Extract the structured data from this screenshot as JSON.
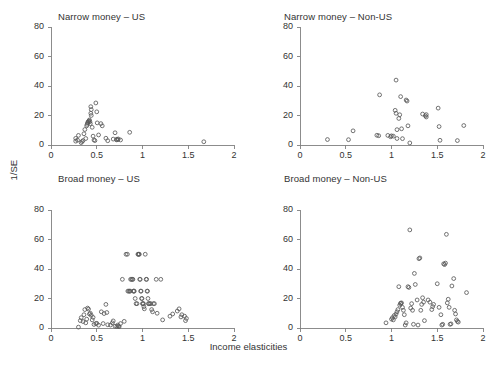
{
  "figure": {
    "xlabel": "Income elasticities",
    "ylabel": "1/SE",
    "background": "#ffffff",
    "marker_color": "#5a5a5a",
    "axis_color": "#808080"
  },
  "chart_data": [
    {
      "type": "scatter",
      "title": "Narrow money – US",
      "xlabel": "Income elasticities",
      "ylabel": "1/SE",
      "xlim": [
        0,
        2
      ],
      "ylim": [
        0,
        80
      ],
      "xticks": [
        0,
        0.5,
        1,
        1.5,
        2
      ],
      "xticklabels": [
        "0",
        "0.5",
        "1",
        "1.5",
        "2"
      ],
      "yticks": [
        0,
        20,
        40,
        60,
        80
      ],
      "yticklabels": [
        "0",
        "20",
        "40",
        "60",
        "80"
      ],
      "grid": false,
      "legend": null,
      "points": [
        [
          0.27,
          4.5
        ],
        [
          0.27,
          2.6
        ],
        [
          0.29,
          3.3
        ],
        [
          0.3,
          6.5
        ],
        [
          0.33,
          1.6
        ],
        [
          0.34,
          2.4
        ],
        [
          0.35,
          3.0
        ],
        [
          0.36,
          7.6
        ],
        [
          0.37,
          10.5
        ],
        [
          0.38,
          4.4
        ],
        [
          0.39,
          13.0
        ],
        [
          0.395,
          14.0
        ],
        [
          0.4,
          15.0
        ],
        [
          0.405,
          15.5
        ],
        [
          0.41,
          16.0
        ],
        [
          0.415,
          16.4
        ],
        [
          0.42,
          17.0
        ],
        [
          0.425,
          15.8
        ],
        [
          0.43,
          14.5
        ],
        [
          0.435,
          21.5
        ],
        [
          0.44,
          20.0
        ],
        [
          0.44,
          24.0
        ],
        [
          0.435,
          26.0
        ],
        [
          0.45,
          12.0
        ],
        [
          0.46,
          6.0
        ],
        [
          0.47,
          3.4
        ],
        [
          0.48,
          3.0
        ],
        [
          0.49,
          28.5
        ],
        [
          0.5,
          22.5
        ],
        [
          0.505,
          15.0
        ],
        [
          0.52,
          6.8
        ],
        [
          0.545,
          14.5
        ],
        [
          0.56,
          13.0
        ],
        [
          0.6,
          4.6
        ],
        [
          0.62,
          2.9
        ],
        [
          0.68,
          4.0
        ],
        [
          0.7,
          8.3
        ],
        [
          0.715,
          3.5
        ],
        [
          0.72,
          3.9
        ],
        [
          0.73,
          3.6
        ],
        [
          0.735,
          4.1
        ],
        [
          0.76,
          3.4
        ],
        [
          0.86,
          8.6
        ],
        [
          1.67,
          2.2
        ]
      ]
    },
    {
      "type": "scatter",
      "title": "Narrow money – Non-US",
      "xlabel": "Income elasticities",
      "ylabel": "1/SE",
      "xlim": [
        0,
        2
      ],
      "ylim": [
        0,
        80
      ],
      "xticks": [
        0,
        0.5,
        1,
        1.5,
        2
      ],
      "xticklabels": [
        "0",
        "0.5",
        "1",
        "1.5",
        "2"
      ],
      "yticks": [
        0,
        20,
        40,
        60,
        80
      ],
      "yticklabels": [
        "0",
        "20",
        "40",
        "60",
        "80"
      ],
      "grid": false,
      "legend": null,
      "points": [
        [
          0.3,
          3.7
        ],
        [
          0.53,
          3.6
        ],
        [
          0.58,
          9.6
        ],
        [
          0.84,
          6.6
        ],
        [
          0.86,
          6.3
        ],
        [
          0.87,
          34.0
        ],
        [
          0.96,
          6.5
        ],
        [
          0.99,
          5.6
        ],
        [
          1.0,
          6.2
        ],
        [
          1.02,
          6.0
        ],
        [
          1.04,
          23.5
        ],
        [
          1.05,
          44.0
        ],
        [
          1.05,
          21.5
        ],
        [
          1.06,
          10.4
        ],
        [
          1.06,
          4.4
        ],
        [
          1.08,
          18.0
        ],
        [
          1.09,
          20.5
        ],
        [
          1.1,
          32.8
        ],
        [
          1.11,
          11.0
        ],
        [
          1.12,
          4.3
        ],
        [
          1.16,
          30.5
        ],
        [
          1.17,
          29.8
        ],
        [
          1.18,
          13.0
        ],
        [
          1.2,
          1.4
        ],
        [
          1.34,
          21.0
        ],
        [
          1.37,
          19.8
        ],
        [
          1.38,
          20.6
        ],
        [
          1.38,
          19.0
        ],
        [
          1.51,
          25.0
        ],
        [
          1.52,
          12.5
        ],
        [
          1.53,
          3.2
        ],
        [
          1.72,
          3.0
        ],
        [
          1.79,
          13.2
        ]
      ]
    },
    {
      "type": "scatter",
      "title": "Broad money – US",
      "xlabel": "Income elasticities",
      "ylabel": "1/SE",
      "xlim": [
        0,
        2
      ],
      "ylim": [
        0,
        80
      ],
      "xticks": [
        0,
        0.5,
        1,
        1.5,
        2
      ],
      "xticklabels": [
        "0",
        "0.5",
        "1",
        "1.5",
        "2"
      ],
      "yticks": [
        0,
        20,
        40,
        60,
        80
      ],
      "yticklabels": [
        "0",
        "20",
        "40",
        "60",
        "80"
      ],
      "grid": false,
      "legend": null,
      "points": [
        [
          0.3,
          0.6
        ],
        [
          0.32,
          5.0
        ],
        [
          0.33,
          7.0
        ],
        [
          0.35,
          4.4
        ],
        [
          0.36,
          9.0
        ],
        [
          0.37,
          12.5
        ],
        [
          0.38,
          3.5
        ],
        [
          0.39,
          6.0
        ],
        [
          0.4,
          13.5
        ],
        [
          0.41,
          12.8
        ],
        [
          0.42,
          9.5
        ],
        [
          0.43,
          10.0
        ],
        [
          0.44,
          8.6
        ],
        [
          0.45,
          5.5
        ],
        [
          0.46,
          7.2
        ],
        [
          0.47,
          2.4
        ],
        [
          0.49,
          3.0
        ],
        [
          0.5,
          3.2
        ],
        [
          0.52,
          1.9
        ],
        [
          0.55,
          11.0
        ],
        [
          0.57,
          3.0
        ],
        [
          0.58,
          9.8
        ],
        [
          0.6,
          16.0
        ],
        [
          0.61,
          10.5
        ],
        [
          0.62,
          2.2
        ],
        [
          0.65,
          2.0
        ],
        [
          0.67,
          3.5
        ],
        [
          0.68,
          4.8
        ],
        [
          0.7,
          1.2
        ],
        [
          0.72,
          1.0
        ],
        [
          0.73,
          2.0
        ],
        [
          0.74,
          1.3
        ],
        [
          0.745,
          0.9
        ],
        [
          0.76,
          3.0
        ],
        [
          0.78,
          33.0
        ],
        [
          0.8,
          4.5
        ],
        [
          0.82,
          50.0
        ],
        [
          0.835,
          50.0
        ],
        [
          0.84,
          25.0
        ],
        [
          0.85,
          25.0
        ],
        [
          0.86,
          25.0
        ],
        [
          0.865,
          25.0
        ],
        [
          0.87,
          33.0
        ],
        [
          0.88,
          33.0
        ],
        [
          0.89,
          33.0
        ],
        [
          0.895,
          33.0
        ],
        [
          0.9,
          25.0
        ],
        [
          0.905,
          25.0
        ],
        [
          0.91,
          25.0
        ],
        [
          0.92,
          20.0
        ],
        [
          0.93,
          16.5
        ],
        [
          0.94,
          16.5
        ],
        [
          0.95,
          50.0
        ],
        [
          0.955,
          50.0
        ],
        [
          0.96,
          50.0
        ],
        [
          0.965,
          50.0
        ],
        [
          0.97,
          33.0
        ],
        [
          0.975,
          33.0
        ],
        [
          0.98,
          25.0
        ],
        [
          0.985,
          25.0
        ],
        [
          0.99,
          20.0
        ],
        [
          0.995,
          20.0
        ],
        [
          1.0,
          16.5
        ],
        [
          1.005,
          16.5
        ],
        [
          1.01,
          16.5
        ],
        [
          1.015,
          14.5
        ],
        [
          1.02,
          13.0
        ],
        [
          1.03,
          50.0
        ],
        [
          1.04,
          33.0
        ],
        [
          1.045,
          33.0
        ],
        [
          1.05,
          25.0
        ],
        [
          1.055,
          25.0
        ],
        [
          1.06,
          20.0
        ],
        [
          1.065,
          16.5
        ],
        [
          1.07,
          16.5
        ],
        [
          1.08,
          16.5
        ],
        [
          1.09,
          16.5
        ],
        [
          1.1,
          12.5
        ],
        [
          1.11,
          11.0
        ],
        [
          1.12,
          16.5
        ],
        [
          1.13,
          16.5
        ],
        [
          1.15,
          33.0
        ],
        [
          1.16,
          10.0
        ],
        [
          1.2,
          33.0
        ],
        [
          1.22,
          5.5
        ],
        [
          1.3,
          8.0
        ],
        [
          1.33,
          9.5
        ],
        [
          1.38,
          11.5
        ],
        [
          1.4,
          13.0
        ],
        [
          1.42,
          7.5
        ],
        [
          1.43,
          9.0
        ],
        [
          1.46,
          8.0
        ],
        [
          1.47,
          5.0
        ],
        [
          1.48,
          6.5
        ]
      ]
    },
    {
      "type": "scatter",
      "title": "Broad money – Non-US",
      "xlabel": "Income elasticities",
      "ylabel": "1/SE",
      "xlim": [
        0,
        2
      ],
      "ylim": [
        0,
        80
      ],
      "xticks": [
        0,
        0.5,
        1,
        1.5,
        2
      ],
      "xticklabels": [
        "0",
        "0.5",
        "1",
        "1.5",
        "2"
      ],
      "yticks": [
        0,
        20,
        40,
        60,
        80
      ],
      "yticklabels": [
        "0",
        "20",
        "40",
        "60",
        "80"
      ],
      "grid": false,
      "legend": null,
      "points": [
        [
          0.94,
          3.5
        ],
        [
          1.0,
          6.0
        ],
        [
          1.01,
          7.0
        ],
        [
          1.02,
          5.5
        ],
        [
          1.03,
          8.5
        ],
        [
          1.04,
          7.5
        ],
        [
          1.05,
          9.5
        ],
        [
          1.06,
          11.0
        ],
        [
          1.07,
          12.5
        ],
        [
          1.08,
          28.0
        ],
        [
          1.09,
          15.5
        ],
        [
          1.1,
          16.5
        ],
        [
          1.1,
          16.8
        ],
        [
          1.11,
          17.0
        ],
        [
          1.12,
          14.0
        ],
        [
          1.13,
          12.0
        ],
        [
          1.14,
          9.0
        ],
        [
          1.15,
          2.0
        ],
        [
          1.16,
          3.5
        ],
        [
          1.18,
          28.0
        ],
        [
          1.19,
          27.5
        ],
        [
          1.2,
          66.5
        ],
        [
          1.21,
          13.5
        ],
        [
          1.22,
          16.5
        ],
        [
          1.23,
          12.0
        ],
        [
          1.24,
          2.5
        ],
        [
          1.25,
          37.0
        ],
        [
          1.26,
          29.5
        ],
        [
          1.28,
          19.0
        ],
        [
          1.29,
          2.0
        ],
        [
          1.3,
          47.0
        ],
        [
          1.31,
          47.5
        ],
        [
          1.32,
          12.0
        ],
        [
          1.33,
          16.0
        ],
        [
          1.34,
          20.5
        ],
        [
          1.35,
          17.5
        ],
        [
          1.36,
          5.0
        ],
        [
          1.4,
          19.0
        ],
        [
          1.42,
          17.5
        ],
        [
          1.44,
          12.5
        ],
        [
          1.45,
          14.5
        ],
        [
          1.46,
          16.0
        ],
        [
          1.5,
          30.0
        ],
        [
          1.52,
          14.0
        ],
        [
          1.54,
          9.0
        ],
        [
          1.55,
          2.0
        ],
        [
          1.56,
          2.5
        ],
        [
          1.57,
          43.5
        ],
        [
          1.58,
          43.0
        ],
        [
          1.59,
          44.0
        ],
        [
          1.6,
          63.5
        ],
        [
          1.61,
          17.0
        ],
        [
          1.62,
          19.5
        ],
        [
          1.63,
          14.0
        ],
        [
          1.64,
          2.5
        ],
        [
          1.65,
          2.8
        ],
        [
          1.66,
          28.5
        ],
        [
          1.68,
          33.5
        ],
        [
          1.69,
          12.0
        ],
        [
          1.7,
          9.5
        ],
        [
          1.71,
          5.5
        ],
        [
          1.72,
          4.5
        ],
        [
          1.73,
          4.0
        ],
        [
          1.82,
          24.0
        ]
      ]
    }
  ]
}
